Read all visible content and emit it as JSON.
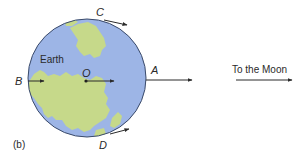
{
  "diagram": {
    "panel_label": "(b)",
    "body_label": "Earth",
    "points": {
      "center": "O",
      "far_side": "A",
      "near_side": "B",
      "top": "C",
      "bottom": "D"
    },
    "direction_label": "To the Moon",
    "colors": {
      "ocean": "#9db5e6",
      "land": "#c6d98a",
      "outline": "#3a4a6a",
      "arrow": "#2a2a2a",
      "text": "#2a2a2a"
    }
  }
}
